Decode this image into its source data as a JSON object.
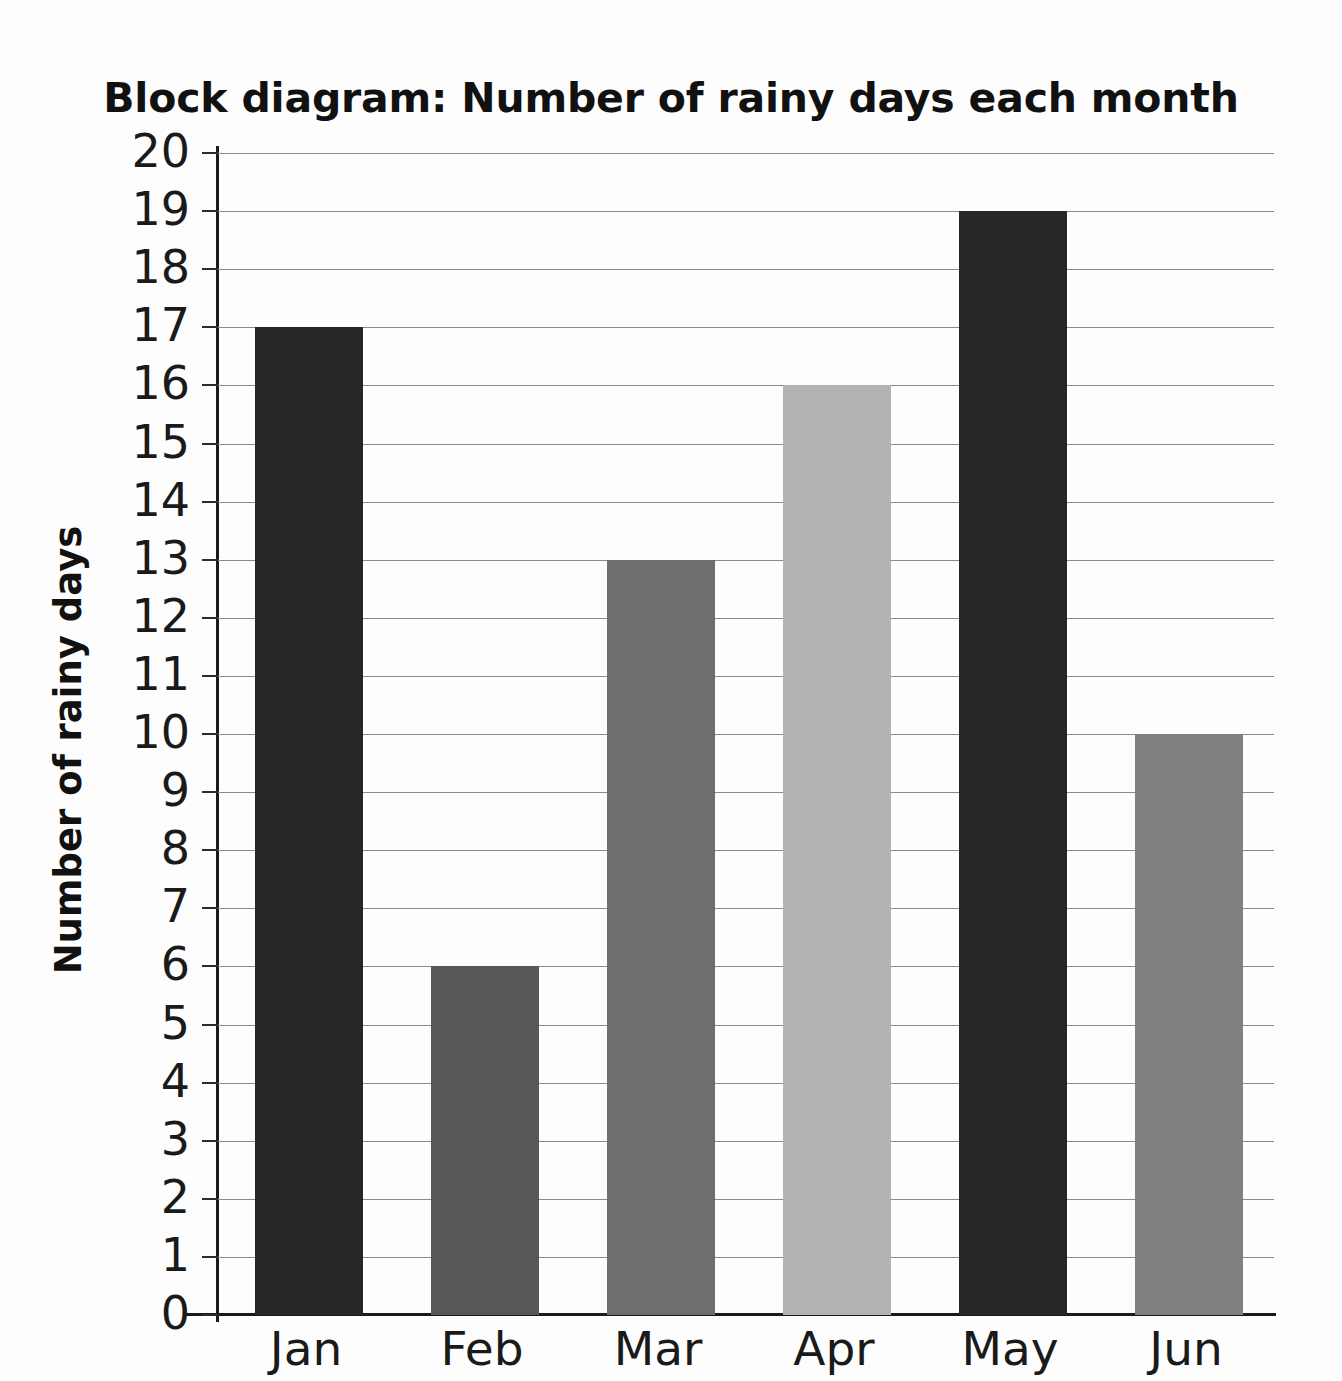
{
  "chart_data": {
    "type": "bar",
    "title": "Block diagram: Number of rainy days each month",
    "xlabel": "",
    "ylabel": "Number of rainy days",
    "categories": [
      "Jan",
      "Feb",
      "Mar",
      "Apr",
      "May",
      "Jun"
    ],
    "values": [
      17,
      6,
      13,
      16,
      19,
      10
    ],
    "bar_colors": [
      "#262626",
      "#575757",
      "#6e6e6e",
      "#b3b3b3",
      "#262626",
      "#808080"
    ],
    "ylim": [
      0,
      20
    ],
    "ytick_labels": [
      "20",
      "19",
      "18",
      "17",
      "16",
      "15",
      "14",
      "13",
      "12",
      "11",
      "10",
      "9",
      "8",
      "7",
      "6",
      "5",
      "4",
      "3",
      "2",
      "1",
      "0"
    ],
    "ytick_values": [
      20,
      19,
      18,
      17,
      16,
      15,
      14,
      13,
      12,
      11,
      10,
      9,
      8,
      7,
      6,
      5,
      4,
      3,
      2,
      1,
      0
    ],
    "grid": true,
    "gridline_color": "#8a8a8a",
    "axis_color": "#1a1a1a",
    "legend": null,
    "legend_position": "none",
    "background": "#ffffff"
  }
}
